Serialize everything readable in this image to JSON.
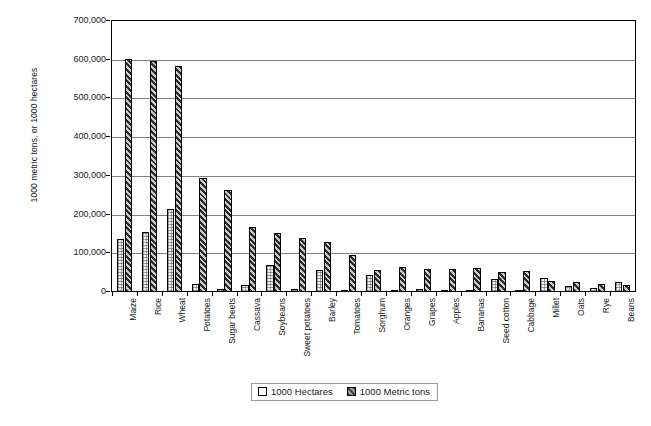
{
  "chart_data": {
    "type": "bar",
    "title": "",
    "xlabel": "",
    "ylabel": "1000 metric tons, or 1000 hectares",
    "ylim": [
      0,
      700000
    ],
    "ytick_step": 100000,
    "ytick_labels": [
      "700,000",
      "600,000",
      "500,000",
      "400,000",
      "300,000",
      "200,000",
      "100,000",
      "0"
    ],
    "ytick_values": [
      700000,
      600000,
      500000,
      400000,
      300000,
      200000,
      100000,
      0
    ],
    "grid": true,
    "legend_position": "bottom",
    "categories": [
      "Maize",
      "Rice",
      "Wheat",
      "Potatoes",
      "Sugar beets",
      "Cassava",
      "Soybeans",
      "Sweet potatoes",
      "Barley",
      "Tomatoes",
      "Sorghum",
      "Oranges",
      "Grapes",
      "Apples",
      "Bananas",
      "Seed cotton",
      "Cabbage",
      "Millet",
      "Oats",
      "Rye",
      "Beans"
    ],
    "series": [
      {
        "name": "1000 Hectares",
        "values": [
          137000,
          154000,
          214000,
          20000,
          9000,
          17000,
          71000,
          9000,
          56000,
          4000,
          44000,
          3000,
          7000,
          6000,
          4000,
          34000,
          2000,
          37000,
          16000,
          10000,
          27000
        ]
      },
      {
        "name": "1000 Metric tons",
        "values": [
          602000,
          597000,
          583000,
          295000,
          263000,
          168000,
          153000,
          140000,
          130000,
          96000,
          58000,
          64000,
          60000,
          59000,
          62000,
          52000,
          55000,
          29000,
          26000,
          20000,
          19000
        ]
      }
    ]
  },
  "legend": {
    "items": [
      {
        "label": "1000 Hectares",
        "swatch": "hectares-swatch"
      },
      {
        "label": "1000 Metric tons",
        "swatch": "metric-tons-swatch"
      }
    ]
  },
  "axes": {
    "y_title": "1000 metric tons, or 1000 hectares"
  }
}
